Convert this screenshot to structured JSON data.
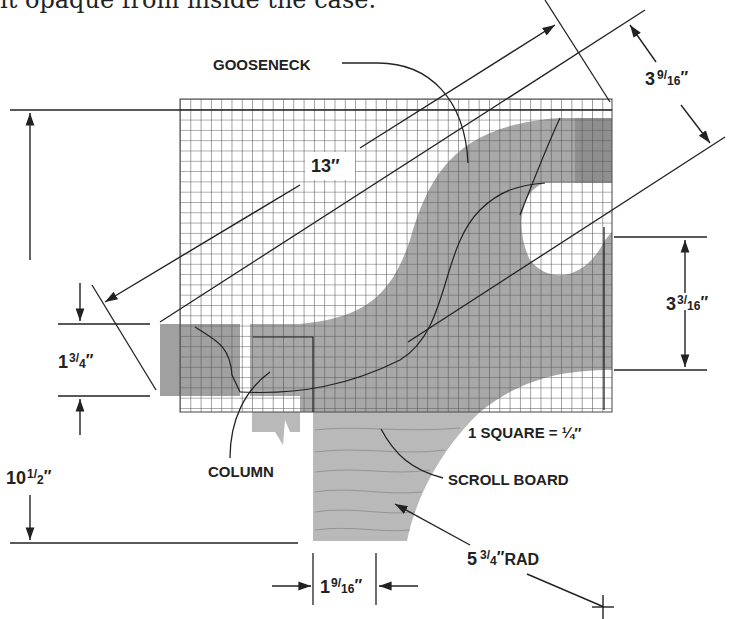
{
  "intro_text": "it opaque from inside the case.",
  "diagram": {
    "grid": {
      "scale_label": "1 SQUARE = ¼″",
      "cell_px": 10.3,
      "cols": 42,
      "rows": 30
    },
    "callouts": {
      "gooseneck": "GOOSENECK",
      "column": "COLUMN",
      "scroll_board": "SCROLL BOARD"
    },
    "dimensions": {
      "diagonal_length": {
        "whole": "13″"
      },
      "width_top": {
        "whole": "3",
        "num": "9",
        "den": "16"
      },
      "right_height": {
        "whole": "3",
        "num": "3",
        "den": "16"
      },
      "left_block": {
        "whole": "1",
        "num": "3",
        "den": "4"
      },
      "total_height": {
        "whole": "10",
        "num": "1",
        "den": "2"
      },
      "bottom_width": {
        "whole": "1",
        "num": "9",
        "den": "16"
      },
      "radius": {
        "whole": "5",
        "num": "3",
        "den": "4",
        "suffix": "RAD"
      }
    },
    "colors": {
      "ink": "#222222",
      "grid_line": "#555555",
      "fill_gray": "#a8a8a8",
      "fill_dark": "#8f8f8f",
      "wood": "#b9b9b9"
    }
  }
}
